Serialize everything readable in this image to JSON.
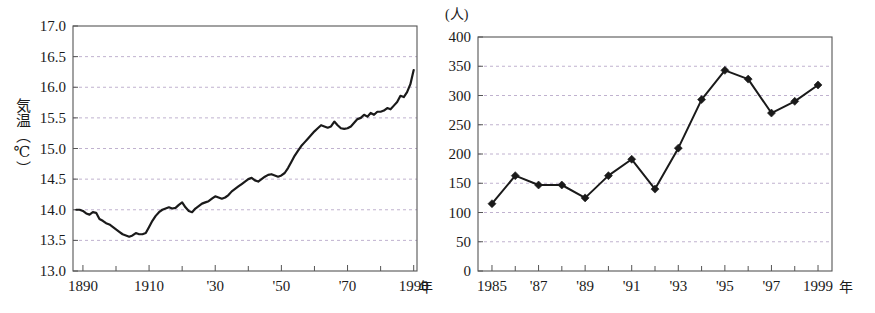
{
  "page": {
    "background_color": "#ffffff",
    "ink_color": "#1a1a1a",
    "grid_color": "#b9a9c9",
    "axis_color": "#555555"
  },
  "figures": [
    {
      "id": "temperature",
      "name": "global-mean-temperature-chart"
    },
    {
      "id": "population",
      "name": "annual-person-count-chart"
    }
  ],
  "chart_data": [
    {
      "type": "line",
      "title": "",
      "xlabel": "年",
      "ylabel": "気温(℃)",
      "ylabel_chars": "気温（℃）",
      "y_unit": "℃",
      "x_unit_suffix": "年",
      "xlim": [
        1887,
        1991
      ],
      "ylim": [
        13.0,
        17.0
      ],
      "grid": true,
      "grid_axis": "y",
      "legend": "none",
      "markers": false,
      "y_ticks": [
        13.0,
        13.5,
        14.0,
        14.5,
        15.0,
        15.5,
        16.0,
        16.5,
        17.0
      ],
      "y_tick_labels": [
        "13.0",
        "13.5",
        "14.0",
        "14.5",
        "15.0",
        "15.5",
        "16.0",
        "16.5",
        "17.0"
      ],
      "x_major_ticks": [
        1890,
        1910,
        1930,
        1950,
        1970,
        1990
      ],
      "x_major_tick_labels": [
        "1890",
        "1910",
        "'30",
        "'50",
        "'70",
        "1990"
      ],
      "x_minor_ticks": [
        1900,
        1920,
        1940,
        1960,
        1980
      ],
      "x": [
        1888,
        1889,
        1890,
        1891,
        1892,
        1893,
        1894,
        1895,
        1896,
        1897,
        1898,
        1899,
        1900,
        1901,
        1902,
        1903,
        1904,
        1905,
        1906,
        1907,
        1908,
        1909,
        1910,
        1911,
        1912,
        1913,
        1914,
        1915,
        1916,
        1917,
        1918,
        1919,
        1920,
        1921,
        1922,
        1923,
        1924,
        1925,
        1926,
        1927,
        1928,
        1929,
        1930,
        1931,
        1932,
        1933,
        1934,
        1935,
        1936,
        1937,
        1938,
        1939,
        1940,
        1941,
        1942,
        1943,
        1944,
        1945,
        1946,
        1947,
        1948,
        1949,
        1950,
        1951,
        1952,
        1953,
        1954,
        1955,
        1956,
        1957,
        1958,
        1959,
        1960,
        1961,
        1962,
        1963,
        1964,
        1965,
        1966,
        1967,
        1968,
        1969,
        1970,
        1971,
        1972,
        1973,
        1974,
        1975,
        1976,
        1977,
        1978,
        1979,
        1980,
        1981,
        1982,
        1983,
        1984,
        1985,
        1986,
        1987,
        1988,
        1989,
        1990
      ],
      "y": [
        14.0,
        14.0,
        13.98,
        13.94,
        13.92,
        13.96,
        13.95,
        13.85,
        13.82,
        13.78,
        13.76,
        13.72,
        13.68,
        13.64,
        13.6,
        13.58,
        13.56,
        13.58,
        13.62,
        13.6,
        13.6,
        13.62,
        13.72,
        13.82,
        13.9,
        13.96,
        14.0,
        14.02,
        14.04,
        14.02,
        14.03,
        14.08,
        14.12,
        14.04,
        13.98,
        13.96,
        14.02,
        14.06,
        14.1,
        14.12,
        14.14,
        14.18,
        14.22,
        14.2,
        14.18,
        14.2,
        14.24,
        14.3,
        14.34,
        14.38,
        14.42,
        14.46,
        14.5,
        14.52,
        14.48,
        14.46,
        14.5,
        14.54,
        14.57,
        14.58,
        14.56,
        14.54,
        14.56,
        14.6,
        14.68,
        14.78,
        14.88,
        14.96,
        15.04,
        15.1,
        15.16,
        15.22,
        15.28,
        15.33,
        15.38,
        15.36,
        15.34,
        15.36,
        15.44,
        15.38,
        15.33,
        15.32,
        15.33,
        15.36,
        15.42,
        15.48,
        15.5,
        15.55,
        15.52,
        15.58,
        15.55,
        15.6,
        15.6,
        15.62,
        15.66,
        15.64,
        15.7,
        15.76,
        15.86,
        15.84,
        15.92,
        16.05,
        16.28
      ]
    },
    {
      "type": "line",
      "title": "",
      "xlabel": "年",
      "ylabel": "(人)",
      "y_unit": "人",
      "x_unit_suffix": "年",
      "xlim": [
        1984.4,
        1999.6
      ],
      "ylim": [
        0,
        400
      ],
      "grid": true,
      "grid_axis": "y",
      "legend": "none",
      "markers": true,
      "marker_shape": "diamond",
      "y_ticks": [
        0,
        50,
        100,
        150,
        200,
        250,
        300,
        350,
        400
      ],
      "y_tick_labels": [
        "0",
        "50",
        "100",
        "150",
        "200",
        "250",
        "300",
        "350",
        "400"
      ],
      "x_major_ticks": [
        1985,
        1987,
        1989,
        1991,
        1993,
        1995,
        1997,
        1999
      ],
      "x_major_tick_labels": [
        "1985",
        "'87",
        "'89",
        "'91",
        "'93",
        "'95",
        "'97",
        "1999"
      ],
      "x_minor_ticks": [
        1986,
        1988,
        1990,
        1992,
        1994,
        1996,
        1998
      ],
      "categories": [
        1985,
        1986,
        1987,
        1988,
        1989,
        1990,
        1991,
        1992,
        1993,
        1994,
        1995,
        1996,
        1997,
        1998,
        1999
      ],
      "values": [
        115,
        163,
        147,
        147,
        125,
        163,
        191,
        140,
        210,
        293,
        343,
        328,
        270,
        290,
        318
      ]
    }
  ]
}
